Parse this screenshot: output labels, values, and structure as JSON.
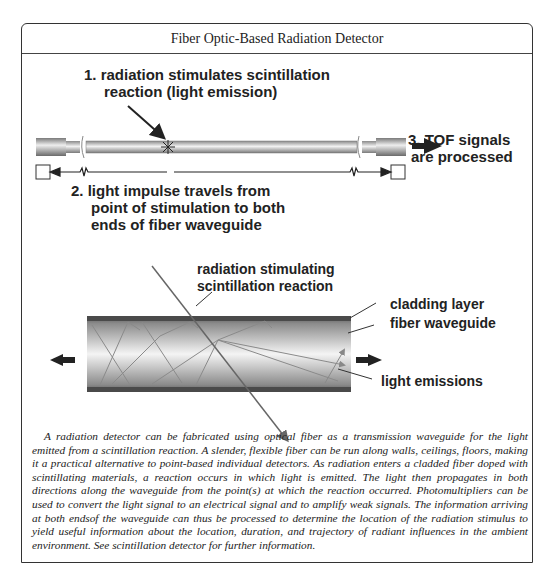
{
  "figure": {
    "title": "Fiber Optic-Based Radiation Detector",
    "top_diagram": {
      "step1": [
        "1. radiation stimulates scintillation",
        "reaction (light emission)"
      ],
      "step2": [
        "2. light impulse travels from",
        "point of stimulation to both",
        "ends of fiber waveguide"
      ],
      "step3": [
        "3. TOF signals",
        "are processed"
      ]
    },
    "bottom_diagram": {
      "radiation_label": [
        "radiation stimulating",
        "scintillation reaction"
      ],
      "cladding_label": "cladding layer",
      "waveguide_label": "fiber waveguide",
      "emissions_label": "light emissions"
    },
    "caption": "A radiation detector can be fabricated using optical fiber as a transmission waveguide for the light emitted from a scintillation reaction. A slender, flexible fiber can be run along walls, ceilings, floors, making it a practical alternative to point-based individual detectors. As radiation enters a cladded fiber doped with scintillating materials, a reaction occurs in which light is emitted. The light then propagates in both directions along the waveguide from the point(s) at which the reaction occurred. Photomultipliers can be used to convert the light signal to an electrical signal and to amplify weak signals. The information arriving at both endsof the waveguide can thus be processed to determine the location of the radiation stimulus to yield useful information about the location, duration, and trajectory of radiant influences in the ambient environment. See scintillation detector for further information."
  },
  "colors": {
    "frame": "#333333",
    "text": "#222222",
    "cladding": "#4a4a4a",
    "ray": "#777777"
  }
}
